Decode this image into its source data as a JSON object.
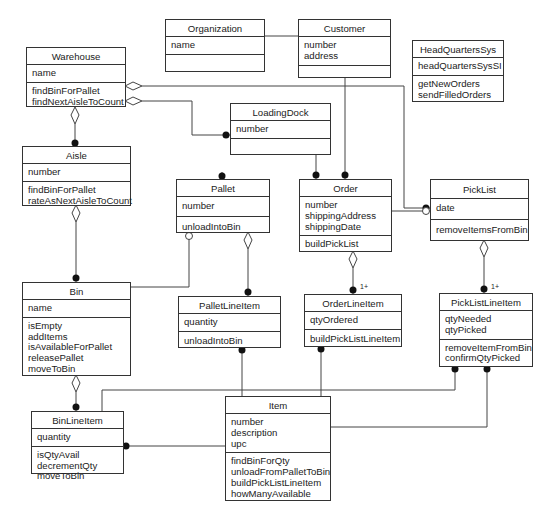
{
  "diagram": {
    "type": "UML class diagram",
    "classes": {
      "organization": {
        "name": "Organization",
        "attributes": [
          "name"
        ],
        "operations": []
      },
      "customer": {
        "name": "Customer",
        "attributes": [
          "number",
          "address"
        ],
        "operations": []
      },
      "headquarters": {
        "name": "HeadQuartersSys",
        "attributes": [
          "headQuartersSysSI"
        ],
        "operations": [
          "getNewOrders",
          "sendFilledOrders"
        ]
      },
      "warehouse": {
        "name": "Warehouse",
        "attributes": [
          "name"
        ],
        "operations": [
          "findBinForPallet",
          "findNextAisleToCount"
        ]
      },
      "loadingdock": {
        "name": "LoadingDock",
        "attributes": [
          "number"
        ],
        "operations": []
      },
      "aisle": {
        "name": "Aisle",
        "attributes": [
          "number"
        ],
        "operations": [
          "findBinForPallet",
          "rateAsNextAisleToCount"
        ]
      },
      "pallet": {
        "name": "Pallet",
        "attributes": [
          "number"
        ],
        "operations": [
          "unloadIntoBin"
        ]
      },
      "order": {
        "name": "Order",
        "attributes": [
          "number",
          "shippingAddress",
          "shippingDate"
        ],
        "operations": [
          "buildPickList"
        ]
      },
      "picklist": {
        "name": "PickList",
        "attributes": [
          "date"
        ],
        "operations": [
          "removeItemsFromBin"
        ]
      },
      "bin": {
        "name": "Bin",
        "attributes": [
          "name"
        ],
        "operations": [
          "isEmpty",
          "addItems",
          "isAvailableForPallet",
          "releasePallet",
          "moveToBin"
        ]
      },
      "palletlineitem": {
        "name": "PalletLineItem",
        "attributes": [
          "quantity"
        ],
        "operations": [
          "unloadIntoBin"
        ]
      },
      "orderlineitem": {
        "name": "OrderLineItem",
        "attributes": [
          "qtyOrdered"
        ],
        "operations": [
          "buildPickListLineItem"
        ]
      },
      "picklistlineitem": {
        "name": "PickListLineItem",
        "attributes": [
          "qtyNeeded",
          "qtyPicked"
        ],
        "operations": [
          "removeItemFromBin",
          "confirmQtyPicked"
        ]
      },
      "binlineitem": {
        "name": "BinLineItem",
        "attributes": [
          "quantity"
        ],
        "operations": [
          "isQtyAvail",
          "decrementQty",
          "moveToBin"
        ]
      },
      "item": {
        "name": "Item",
        "attributes": [
          "number",
          "description",
          "upc"
        ],
        "operations": [
          "findBinForQty",
          "unloadFromPalletToBin",
          "buildPickListLineItem",
          "howManyAvailable"
        ]
      }
    },
    "multiplicities": {
      "order_orderlineitem": "1+",
      "picklist_picklistlineitem": "1+"
    },
    "relationships": [
      {
        "from": "Organization",
        "to": "Customer",
        "kind": "association"
      },
      {
        "from": "Warehouse",
        "to": "PickList",
        "kind": "aggregation",
        "target_end": "many"
      },
      {
        "from": "Warehouse",
        "to": "LoadingDock",
        "kind": "aggregation",
        "target_end": "many"
      },
      {
        "from": "Warehouse",
        "to": "Aisle",
        "kind": "aggregation",
        "target_end": "many"
      },
      {
        "from": "LoadingDock",
        "to": "Pallet",
        "kind": "association",
        "target_end": "many"
      },
      {
        "from": "LoadingDock",
        "to": "Order",
        "kind": "association",
        "target_end": "many"
      },
      {
        "from": "Customer",
        "to": "Order",
        "kind": "association",
        "target_end": "many"
      },
      {
        "from": "Order",
        "to": "PickList",
        "kind": "association",
        "target_end": "optional"
      },
      {
        "from": "Aisle",
        "to": "Bin",
        "kind": "aggregation",
        "target_end": "many"
      },
      {
        "from": "Pallet",
        "to": "Bin",
        "kind": "association",
        "source_end": "optional"
      },
      {
        "from": "Pallet",
        "to": "PalletLineItem",
        "kind": "aggregation",
        "target_end": "many"
      },
      {
        "from": "Order",
        "to": "OrderLineItem",
        "kind": "aggregation",
        "target_end": "1+"
      },
      {
        "from": "PickList",
        "to": "PickListLineItem",
        "kind": "aggregation",
        "target_end": "1+"
      },
      {
        "from": "Bin",
        "to": "BinLineItem",
        "kind": "aggregation",
        "target_end": "many"
      },
      {
        "from": "PalletLineItem",
        "to": "Item",
        "kind": "association",
        "source_end": "many"
      },
      {
        "from": "OrderLineItem",
        "to": "Item",
        "kind": "association",
        "source_end": "many"
      },
      {
        "from": "PickListLineItem",
        "to": "BinLineItem",
        "kind": "association",
        "source_end": "many"
      },
      {
        "from": "PickListLineItem",
        "to": "Item",
        "kind": "association",
        "source_end": "many"
      },
      {
        "from": "Item",
        "to": "BinLineItem",
        "kind": "association",
        "target_end": "many"
      }
    ]
  },
  "colors": {
    "line": "#333333",
    "background": "#ffffff",
    "text": "#222222"
  }
}
